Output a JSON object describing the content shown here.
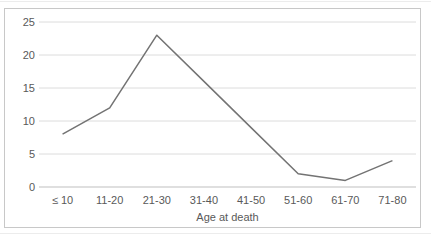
{
  "chart_data": {
    "type": "line",
    "categories": [
      "≤ 10",
      "11-20",
      "21-30",
      "31-40",
      "41-50",
      "51-60",
      "61-70",
      "71-80"
    ],
    "values": [
      8,
      12,
      23,
      16,
      9,
      2,
      1,
      4
    ],
    "series_name": "",
    "title": "",
    "xlabel": "Age at death",
    "ylabel": "",
    "ylim": [
      0,
      25
    ],
    "yticks": [
      0,
      5,
      10,
      15,
      20,
      25
    ],
    "grid": true,
    "legend_position": "none",
    "line_color": "#737373",
    "gridline_color": "#dcdcdc",
    "axis_line_color": "#bfbfbf",
    "label_color": "#595959",
    "frame_border_color": "#c8c8c8"
  }
}
